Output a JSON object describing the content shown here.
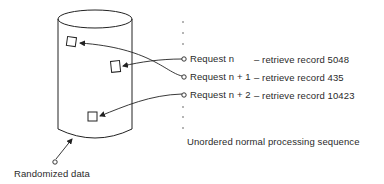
{
  "diagram": {
    "storage_label": "Randomized data",
    "sequence_label": "Unordered normal processing sequence",
    "requests": [
      {
        "label": "Request n",
        "action": "– retrieve record 5048",
        "record": 5048
      },
      {
        "label": "Request n + 1",
        "action": "– retrieve record 435",
        "record": 435
      },
      {
        "label": "Request n + 2",
        "action": "– retrieve record 10423",
        "record": 10423
      }
    ],
    "ellipsis_top": "·\n·\n·",
    "ellipsis_bottom": "·\n·\n·"
  }
}
